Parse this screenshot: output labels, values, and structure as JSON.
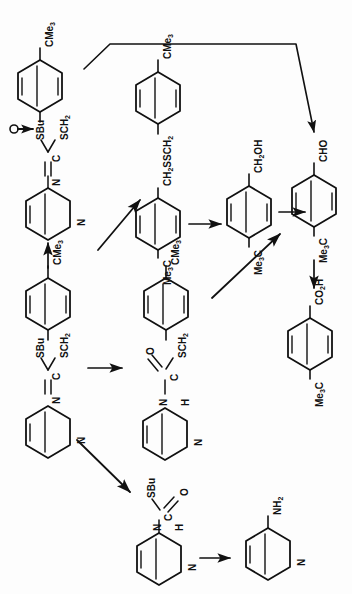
{
  "figure": {
    "type": "chemical-reaction-scheme",
    "orientation_note": "all labels rotated 90 degrees counter-clockwise",
    "ink_color": "#111111",
    "background_color": "#fdfdfd"
  },
  "labels": {
    "cme3_a": "CMe3",
    "sbu_a": "SBu",
    "sch2_a": "SCH2",
    "c_a": "C",
    "n_a": "N",
    "pyridine_n_a": "N",
    "cme3_b": "CMe3",
    "ch2ssch2": "CH2SSCH2",
    "me3c_b": "Me3C",
    "ch2oh": "CH2OH",
    "me3c_c": "Me3C",
    "cho": "CHO",
    "me3c_d": "Me3C",
    "co2h": "CO2H",
    "me3c_e": "Me3C",
    "cme3_f": "CMe3",
    "sbu_f": "SBu",
    "sch2_f": "SCH2",
    "c_f": "C",
    "n_f": "N",
    "pyridine_n_f": "N",
    "cme3_g": "CMe3",
    "sch2_g": "SCH2",
    "o_g": "O",
    "c_g": "C",
    "n_g": "N",
    "h_g": "H",
    "pyridine_n_g": "N",
    "sbu_h": "SBu",
    "o_h": "O",
    "c_h": "C",
    "n_h": "N",
    "h_h": "H",
    "pyridine_n_h": "N",
    "nh2_i": "NH2",
    "pyridine_n_i": "N"
  },
  "structures": [
    {
      "id": "reagent-top-left",
      "name": "S-butyl S-(4-tert-butylbenzyl) N-(3-pyridyl)dithiocarbonimidate",
      "substituents": [
        "CMe3",
        "SCH2",
        "SBu",
        "N",
        "pyridine"
      ]
    },
    {
      "id": "disulfide",
      "name": "bis(4-tert-butylbenzyl) disulfide",
      "substituents": [
        "CMe3",
        "CH2SSCH2",
        "Me3C"
      ]
    },
    {
      "id": "benzyl-alcohol",
      "name": "4-tert-butylbenzyl alcohol",
      "substituents": [
        "CH2OH",
        "Me3C"
      ]
    },
    {
      "id": "benzaldehyde",
      "name": "4-tert-butylbenzaldehyde",
      "substituents": [
        "CHO",
        "Me3C"
      ]
    },
    {
      "id": "benzoic-acid",
      "name": "4-tert-butylbenzoic acid",
      "substituents": [
        "CO2H",
        "Me3C"
      ]
    },
    {
      "id": "reagent-mid-left",
      "name": "S-butyl S-(4-tert-butylbenzyl) N-(3-pyridyl)dithiocarbonimidate",
      "substituents": [
        "CMe3",
        "SCH2",
        "SBu",
        "N",
        "pyridine"
      ]
    },
    {
      "id": "thiocarbamate-benzyl",
      "name": "S-(4-tert-butylbenzyl) N-(3-pyridyl)thiocarbamate",
      "substituents": [
        "CMe3",
        "SCH2",
        "O",
        "N",
        "H",
        "pyridine"
      ]
    },
    {
      "id": "thiocarbamate-sbu",
      "name": "S-butyl N-(3-pyridyl)thiocarbamate",
      "substituents": [
        "SBu",
        "O",
        "N",
        "H",
        "pyridine"
      ]
    },
    {
      "id": "aminopyridine",
      "name": "3-aminopyridine",
      "substituents": [
        "NH2",
        "pyridine"
      ]
    }
  ],
  "arrows": [
    {
      "id": "arrow-long-curved",
      "from": "reagent-top-left",
      "to": "benzaldehyde",
      "style": "polyline"
    },
    {
      "id": "arrow-diag-1",
      "from": "reagent-mid-left",
      "to": "disulfide",
      "style": "diagonal-up-right"
    },
    {
      "id": "arrow-disulfide-to-alcohol",
      "from": "disulfide",
      "to": "benzyl-alcohol",
      "style": "horizontal"
    },
    {
      "id": "arrow-alcohol-to-aldehyde",
      "from": "benzyl-alcohol",
      "to": "benzaldehyde",
      "style": "horizontal"
    },
    {
      "id": "arrow-aldehyde-to-acid",
      "from": "benzaldehyde",
      "to": "benzoic-acid",
      "style": "vertical-down"
    },
    {
      "id": "arrow-diag-2",
      "from": "thiocarbamate-benzyl",
      "to": "benzaldehyde",
      "style": "diagonal-up-right"
    },
    {
      "id": "arrow-reagent-to-thiocarbamate",
      "from": "reagent-mid-left",
      "to": "thiocarbamate-benzyl",
      "style": "horizontal"
    },
    {
      "id": "arrow-diag-3",
      "from": "reagent-mid-left",
      "to": "thiocarbamate-sbu",
      "style": "diagonal-down-right"
    },
    {
      "id": "arrow-thiocarbamate-to-amine",
      "from": "thiocarbamate-sbu",
      "to": "aminopyridine",
      "style": "horizontal"
    },
    {
      "id": "arrow-vertical-left",
      "from": "reagent-mid-left",
      "to": "reagent-top-left",
      "style": "vertical-up"
    }
  ]
}
